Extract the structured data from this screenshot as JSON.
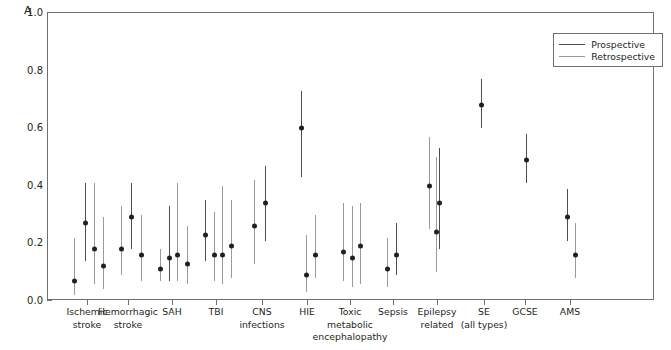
{
  "panel": {
    "label": "A"
  },
  "chart_data": {
    "type": "scatter",
    "title": "",
    "xlabel": "",
    "ylabel": "Proportion with electrographic seizures",
    "ylim": [
      0,
      1
    ],
    "yticks": [
      0.0,
      0.2,
      0.4,
      0.6,
      0.8,
      1.0
    ],
    "ytick_labels": [
      "0.0",
      "0.2",
      "0.4",
      "0.6",
      "0.8",
      "1.0"
    ],
    "grid": false,
    "legend_position": "top-right",
    "legend": [
      {
        "name": "Prospective",
        "color": "#4d4d4d"
      },
      {
        "name": "Retrospective",
        "color": "#9a9a9a"
      }
    ],
    "categories": [
      "Ischemic\nstroke",
      "Hemorrhagic\nstroke",
      "SAH",
      "TBI",
      "CNS\ninfections",
      "HIE",
      "Toxic\nmetabolic\nencephalopathy",
      "Sepsis",
      "Epilepsy\nrelated",
      "SE\n(all types)",
      "GCSE",
      "AMS"
    ],
    "points": [
      {
        "category": "Ischemic stroke",
        "x": 73,
        "value": 0.07,
        "low": 0.02,
        "high": 0.22,
        "series": "Retrospective"
      },
      {
        "category": "Ischemic stroke",
        "x": 84,
        "value": 0.27,
        "low": 0.14,
        "high": 0.41,
        "series": "Prospective"
      },
      {
        "category": "Ischemic stroke",
        "x": 93,
        "value": 0.18,
        "low": 0.06,
        "high": 0.41,
        "series": "Retrospective"
      },
      {
        "category": "Ischemic stroke",
        "x": 102,
        "value": 0.12,
        "low": 0.04,
        "high": 0.29,
        "series": "Retrospective"
      },
      {
        "category": "Hemorrhagic stroke",
        "x": 120,
        "value": 0.18,
        "low": 0.09,
        "high": 0.33,
        "series": "Retrospective"
      },
      {
        "category": "Hemorrhagic stroke",
        "x": 130,
        "value": 0.29,
        "low": 0.18,
        "high": 0.41,
        "series": "Prospective"
      },
      {
        "category": "Hemorrhagic stroke",
        "x": 140,
        "value": 0.16,
        "low": 0.07,
        "high": 0.3,
        "series": "Retrospective"
      },
      {
        "category": "SAH",
        "x": 159,
        "value": 0.11,
        "low": 0.07,
        "high": 0.18,
        "series": "Retrospective"
      },
      {
        "category": "SAH",
        "x": 168,
        "value": 0.15,
        "low": 0.07,
        "high": 0.33,
        "series": "Prospective"
      },
      {
        "category": "SAH",
        "x": 176,
        "value": 0.16,
        "low": 0.07,
        "high": 0.41,
        "series": "Retrospective"
      },
      {
        "category": "SAH",
        "x": 186,
        "value": 0.13,
        "low": 0.06,
        "high": 0.26,
        "series": "Retrospective"
      },
      {
        "category": "TBI",
        "x": 204,
        "value": 0.23,
        "low": 0.14,
        "high": 0.35,
        "series": "Prospective"
      },
      {
        "category": "TBI",
        "x": 213,
        "value": 0.16,
        "low": 0.07,
        "high": 0.31,
        "series": "Retrospective"
      },
      {
        "category": "TBI",
        "x": 221,
        "value": 0.16,
        "low": 0.06,
        "high": 0.4,
        "series": "Retrospective"
      },
      {
        "category": "TBI",
        "x": 230,
        "value": 0.19,
        "low": 0.08,
        "high": 0.35,
        "series": "Retrospective"
      },
      {
        "category": "CNS infections",
        "x": 253,
        "value": 0.26,
        "low": 0.13,
        "high": 0.42,
        "series": "Retrospective"
      },
      {
        "category": "CNS infections",
        "x": 264,
        "value": 0.34,
        "low": 0.21,
        "high": 0.47,
        "series": "Prospective"
      },
      {
        "category": "HIE",
        "x": 300,
        "value": 0.6,
        "low": 0.43,
        "high": 0.73,
        "series": "Prospective"
      },
      {
        "category": "HIE",
        "x": 305,
        "value": 0.09,
        "low": 0.03,
        "high": 0.23,
        "series": "Retrospective"
      },
      {
        "category": "HIE",
        "x": 314,
        "value": 0.16,
        "low": 0.08,
        "high": 0.3,
        "series": "Retrospective"
      },
      {
        "category": "Toxic metabolic encephalopathy",
        "x": 342,
        "value": 0.17,
        "low": 0.07,
        "high": 0.34,
        "series": "Retrospective"
      },
      {
        "category": "Toxic metabolic encephalopathy",
        "x": 351,
        "value": 0.15,
        "low": 0.05,
        "high": 0.33,
        "series": "Retrospective"
      },
      {
        "category": "Toxic metabolic encephalopathy",
        "x": 359,
        "value": 0.19,
        "low": 0.06,
        "high": 0.34,
        "series": "Retrospective"
      },
      {
        "category": "Sepsis",
        "x": 386,
        "value": 0.11,
        "low": 0.05,
        "high": 0.22,
        "series": "Retrospective"
      },
      {
        "category": "Sepsis",
        "x": 395,
        "value": 0.16,
        "low": 0.09,
        "high": 0.27,
        "series": "Prospective"
      },
      {
        "category": "Epilepsy related",
        "x": 428,
        "value": 0.4,
        "low": 0.25,
        "high": 0.57,
        "series": "Retrospective"
      },
      {
        "category": "Epilepsy related",
        "x": 438,
        "value": 0.34,
        "low": 0.18,
        "high": 0.53,
        "series": "Prospective"
      },
      {
        "category": "Epilepsy related",
        "x": 435,
        "value": 0.24,
        "low": 0.1,
        "high": 0.5,
        "series": "Retrospective"
      },
      {
        "category": "SE (all types)",
        "x": 480,
        "value": 0.68,
        "low": 0.6,
        "high": 0.77,
        "series": "Prospective"
      },
      {
        "category": "GCSE",
        "x": 525,
        "value": 0.49,
        "low": 0.41,
        "high": 0.58,
        "series": "Prospective"
      },
      {
        "category": "AMS",
        "x": 566,
        "value": 0.29,
        "low": 0.21,
        "high": 0.39,
        "series": "Prospective"
      },
      {
        "category": "AMS",
        "x": 574,
        "value": 0.16,
        "low": 0.08,
        "high": 0.27,
        "series": "Retrospective"
      }
    ]
  }
}
